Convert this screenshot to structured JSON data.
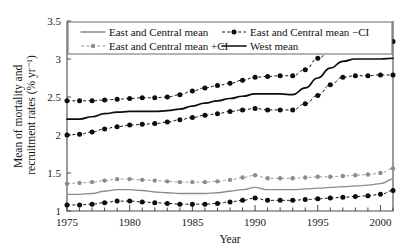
{
  "chart_data": {
    "type": "line",
    "title": "",
    "xlabel": "Year",
    "ylabel": "Mean of mortality and recruitment rates (% yr⁻¹)",
    "xlim": [
      1975,
      2001
    ],
    "ylim": [
      1,
      3.5
    ],
    "xticks": [
      1975,
      1980,
      1985,
      1990,
      1995,
      2000
    ],
    "xtick_labels": [
      "1975",
      "1980",
      "1985",
      "1990",
      "1995",
      "2000"
    ],
    "xminor_step": 1,
    "yticks": [
      1,
      1.5,
      2,
      2.5,
      3,
      3.5
    ],
    "ytick_labels": [
      "1",
      "1.5",
      "2",
      "2.5",
      "3",
      "3.5"
    ],
    "grid": false,
    "legend_position": "top-inside",
    "x": [
      1975,
      1976,
      1977,
      1978,
      1979,
      1980,
      1981,
      1982,
      1983,
      1984,
      1985,
      1986,
      1987,
      1988,
      1989,
      1990,
      1991,
      1992,
      1993,
      1994,
      1995,
      1996,
      1997,
      1998,
      1999,
      2000,
      2001
    ],
    "series": [
      {
        "name": "East and Central mean",
        "style": "solid",
        "color": "#8c8c8c",
        "markers": false,
        "values": [
          1.22,
          1.22,
          1.23,
          1.26,
          1.28,
          1.28,
          1.27,
          1.25,
          1.24,
          1.23,
          1.23,
          1.23,
          1.24,
          1.26,
          1.28,
          1.31,
          1.28,
          1.28,
          1.28,
          1.29,
          1.3,
          1.31,
          1.32,
          1.33,
          1.34,
          1.36,
          1.42
        ]
      },
      {
        "name": "East and Central mean +CI",
        "style": "dashed",
        "color": "#8c8c8c",
        "markers": true,
        "values": [
          1.36,
          1.37,
          1.38,
          1.4,
          1.42,
          1.42,
          1.41,
          1.4,
          1.39,
          1.38,
          1.38,
          1.38,
          1.39,
          1.41,
          1.44,
          1.47,
          1.43,
          1.43,
          1.43,
          1.44,
          1.45,
          1.45,
          1.46,
          1.47,
          1.48,
          1.5,
          1.56
        ]
      },
      {
        "name": "East and Central mean −CI",
        "style": "dashed",
        "color": "#0d0d0d",
        "markers": true,
        "values": [
          1.08,
          1.08,
          1.09,
          1.11,
          1.13,
          1.13,
          1.12,
          1.11,
          1.1,
          1.09,
          1.09,
          1.09,
          1.1,
          1.12,
          1.14,
          1.17,
          1.14,
          1.14,
          1.14,
          1.15,
          1.16,
          1.17,
          1.18,
          1.19,
          1.2,
          1.22,
          1.27
        ]
      },
      {
        "name": "West mean",
        "style": "solid",
        "color": "#0d0d0d",
        "markers": false,
        "values": [
          2.21,
          2.21,
          2.24,
          2.28,
          2.3,
          2.31,
          2.31,
          2.31,
          2.32,
          2.34,
          2.38,
          2.42,
          2.45,
          2.48,
          2.51,
          2.54,
          2.54,
          2.54,
          2.53,
          2.62,
          2.75,
          2.88,
          2.97,
          3.0,
          3.0,
          3.0,
          3.01
        ]
      },
      {
        "name": "West mean upper CI",
        "style": "dashed",
        "color": "#0d0d0d",
        "markers": true,
        "values": [
          2.45,
          2.45,
          2.45,
          2.46,
          2.47,
          2.48,
          2.49,
          2.49,
          2.5,
          2.53,
          2.58,
          2.62,
          2.65,
          2.68,
          2.72,
          2.76,
          2.77,
          2.78,
          2.78,
          2.86,
          3.01,
          3.1,
          3.22,
          3.22,
          3.22,
          3.23,
          3.23
        ]
      },
      {
        "name": "West mean lower CI",
        "style": "dashed",
        "color": "#0d0d0d",
        "markers": true,
        "values": [
          2.0,
          2.01,
          2.04,
          2.08,
          2.11,
          2.13,
          2.14,
          2.15,
          2.17,
          2.2,
          2.23,
          2.26,
          2.28,
          2.31,
          2.33,
          2.35,
          2.33,
          2.33,
          2.33,
          2.41,
          2.52,
          2.66,
          2.76,
          2.78,
          2.78,
          2.79,
          2.79
        ]
      }
    ],
    "legend": [
      {
        "label": "East and Central mean",
        "style": "solid",
        "color": "#8c8c8c",
        "marker": false
      },
      {
        "label": "East and Central mean −CI",
        "style": "dashed",
        "color": "#0d0d0d",
        "marker": true
      },
      {
        "label": "East and Central mean +CI",
        "style": "dashed",
        "color": "#8c8c8c",
        "marker": true
      },
      {
        "label": "West mean",
        "style": "solid",
        "color": "#0d0d0d",
        "marker": false
      }
    ]
  }
}
